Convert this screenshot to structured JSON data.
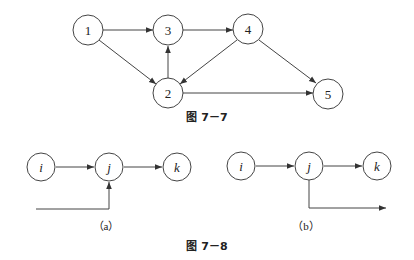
{
  "figure_7_7": {
    "caption": "图 7－7",
    "nodes": [
      {
        "id": "1",
        "label": "1"
      },
      {
        "id": "2",
        "label": "2"
      },
      {
        "id": "3",
        "label": "3"
      },
      {
        "id": "4",
        "label": "4"
      },
      {
        "id": "5",
        "label": "5"
      }
    ],
    "edges": [
      {
        "from": "1",
        "to": "3"
      },
      {
        "from": "1",
        "to": "2"
      },
      {
        "from": "2",
        "to": "3"
      },
      {
        "from": "3",
        "to": "4"
      },
      {
        "from": "4",
        "to": "2"
      },
      {
        "from": "4",
        "to": "5"
      },
      {
        "from": "2",
        "to": "5"
      }
    ]
  },
  "figure_7_8": {
    "caption": "图 7－8",
    "a": {
      "label": "（a）",
      "nodes": [
        {
          "id": "i",
          "label": "i"
        },
        {
          "id": "j",
          "label": "j"
        },
        {
          "id": "k",
          "label": "k"
        }
      ],
      "edges": [
        {
          "from": "i",
          "to": "j"
        },
        {
          "from": "j",
          "to": "k"
        },
        {
          "from": "external",
          "to": "j"
        }
      ]
    },
    "b": {
      "label": "（b）",
      "nodes": [
        {
          "id": "i",
          "label": "i"
        },
        {
          "id": "j",
          "label": "j"
        },
        {
          "id": "k",
          "label": "k"
        }
      ],
      "edges": [
        {
          "from": "i",
          "to": "j"
        },
        {
          "from": "j",
          "to": "k"
        },
        {
          "from": "j",
          "to": "external"
        }
      ]
    }
  }
}
